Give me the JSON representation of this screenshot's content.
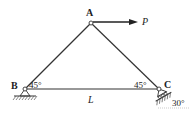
{
  "diagram": {
    "type": "truss",
    "nodes": {
      "A": {
        "label": "A"
      },
      "B": {
        "label": "B"
      },
      "C": {
        "label": "C"
      }
    },
    "load": {
      "label": "P"
    },
    "span_label": "L",
    "angle_B": "45°",
    "angle_C": "45°",
    "support_C_angle": "30°",
    "colors": {
      "line": "#333333",
      "background": "#ffffff"
    }
  }
}
